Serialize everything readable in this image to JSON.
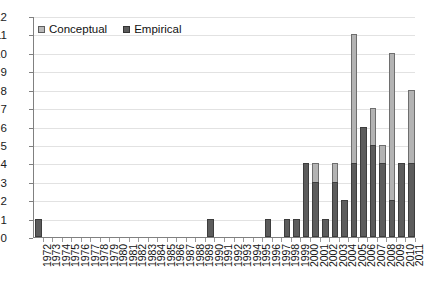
{
  "chart_data": {
    "type": "bar",
    "stacked": true,
    "title": "",
    "subtitle": "",
    "xlabel": "",
    "ylabel": "",
    "ylim": [
      0,
      12
    ],
    "ytick_labels": [
      "12",
      "11",
      "10",
      "9",
      "8",
      "7",
      "6",
      "5",
      "4",
      "3",
      "2",
      "1",
      "0"
    ],
    "ytick_values": [
      12,
      11,
      10,
      9,
      8,
      7,
      6,
      5,
      4,
      3,
      2,
      1,
      0
    ],
    "grid": true,
    "legend_position": "top-left",
    "categories": [
      "1972",
      "1973",
      "1974",
      "1975",
      "1976",
      "1977",
      "1978",
      "1979",
      "1980",
      "1981",
      "1982",
      "1983",
      "1984",
      "1985",
      "1986",
      "1987",
      "1988",
      "1989",
      "1990",
      "1991",
      "1992",
      "1993",
      "1994",
      "1995",
      "1996",
      "1997",
      "1998",
      "1999",
      "2000",
      "2001",
      "2002",
      "2003",
      "2004",
      "2005",
      "2006",
      "2007",
      "2008",
      "2009",
      "2010",
      "2011"
    ],
    "series": [
      {
        "name": "Empirical",
        "color": "#5c5c5c",
        "values": [
          1,
          0,
          0,
          0,
          0,
          0,
          0,
          0,
          0,
          0,
          0,
          0,
          0,
          0,
          0,
          0,
          0,
          0,
          1,
          0,
          0,
          0,
          0,
          0,
          1,
          0,
          1,
          1,
          4,
          3,
          1,
          3,
          2,
          4,
          6,
          5,
          4,
          2,
          4,
          4
        ]
      },
      {
        "name": "Conceptual",
        "color": "#b3b3b3",
        "values": [
          0,
          0,
          0,
          0,
          0,
          0,
          0,
          0,
          0,
          0,
          0,
          0,
          0,
          0,
          0,
          0,
          0,
          0,
          0,
          0,
          0,
          0,
          0,
          0,
          0,
          0,
          0,
          0,
          0,
          1,
          0,
          1,
          0,
          7,
          0,
          2,
          1,
          8,
          0,
          4
        ]
      }
    ],
    "totals": [
      1,
      0,
      0,
      0,
      0,
      0,
      0,
      0,
      0,
      0,
      0,
      0,
      0,
      0,
      0,
      0,
      0,
      0,
      1,
      0,
      0,
      0,
      0,
      0,
      1,
      0,
      1,
      1,
      4,
      4,
      1,
      4,
      2,
      11,
      6,
      7,
      5,
      10,
      4,
      8
    ]
  },
  "legend": {
    "entries": [
      {
        "label": "Conceptual",
        "swatch": "conceptual-swatch-icon"
      },
      {
        "label": "Empirical",
        "swatch": "empirical-swatch-icon"
      }
    ]
  }
}
